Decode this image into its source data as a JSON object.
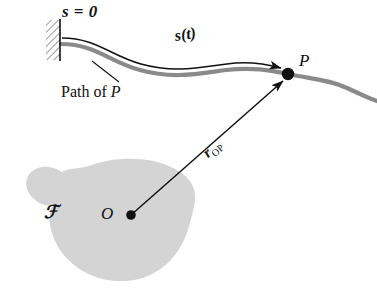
{
  "figure": {
    "domain": "diagram",
    "title_visible": false,
    "background_color": "#ffffff",
    "width": 377,
    "height": 293
  },
  "colors": {
    "path_gray": "#8a8a8a",
    "body_fill": "#d4d4d4",
    "ink_black": "#111111",
    "hatch_gray": "#707070"
  },
  "labels": {
    "datum": "s = 0",
    "arc_length": "s(t)",
    "path_caption_prefix": "Path of ",
    "path_caption_point": "P",
    "point_p": "P",
    "point_o": "O",
    "frame": "ℱ",
    "vector_symbol": "r",
    "vector_subscript": "OP"
  },
  "elements": {
    "wall": {
      "name": "fixed-wall-support",
      "hatched": true,
      "x": 46,
      "y": 20,
      "width": 14,
      "height": 40
    },
    "path_curve": {
      "name": "particle-path",
      "color": "#8a8a8a",
      "stroke_width": 4.2,
      "start": [
        61,
        44
      ],
      "end": [
        377,
        101
      ]
    },
    "arc_length_arrow": {
      "name": "arc-length-arrow",
      "color": "#111111",
      "from": [
        62,
        38
      ],
      "to": [
        283,
        70
      ]
    },
    "position_vector": {
      "name": "position-vector-arrow",
      "color": "#111111",
      "from": [
        131,
        215
      ],
      "to": [
        286,
        78
      ]
    },
    "leader_line": {
      "name": "path-caption-leader",
      "from": [
        118,
        82
      ],
      "to": [
        92,
        62
      ]
    },
    "point_p_dot": {
      "name": "point-p-marker",
      "cx": 288,
      "cy": 74,
      "r": 6
    },
    "point_o_dot": {
      "name": "point-o-marker",
      "cx": 131,
      "cy": 215,
      "r": 5
    },
    "body_blob": {
      "name": "reference-frame-body",
      "fill": "#d4d4d4"
    }
  }
}
